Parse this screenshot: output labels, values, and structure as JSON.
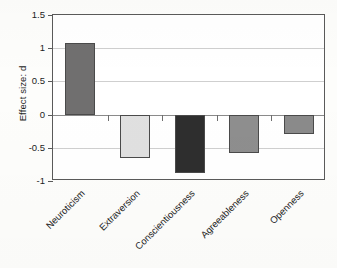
{
  "chart_data": {
    "type": "bar",
    "title": "",
    "subtitle": "",
    "xlabel": "",
    "ylabel": "Effect size: d",
    "categories": [
      "Neuroticism",
      "Extraversion",
      "Conscientiousness",
      "Agreeableness",
      "Openness"
    ],
    "values": [
      1.08,
      -0.65,
      -0.88,
      -0.58,
      -0.29
    ],
    "bar_colors": [
      "#706f6f",
      "#e0e0e0",
      "#2e2e2e",
      "#8e8e8e",
      "#8a8a8a"
    ],
    "ylim": [
      -1,
      1.5
    ],
    "yticks": [
      1.5,
      1,
      0.5,
      0,
      -0.5,
      -1
    ],
    "ytick_labels": [
      "1.5",
      "1",
      "0.5",
      "0",
      "-0.5",
      "-1"
    ],
    "grid": true,
    "legend": "none",
    "annotations": [],
    "zero_reference_line": 0
  },
  "figure": {
    "background_color": "#fdfdfb",
    "plot_background_color": "#ffffff",
    "frame_color": "#5a5a5a",
    "gridline_color": "#cfcfcf",
    "label_rotation_degrees": -45
  }
}
